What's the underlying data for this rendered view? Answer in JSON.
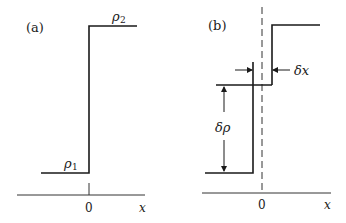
{
  "figure": {
    "panel_a": {
      "label": "(a)",
      "rho_low": "ρ",
      "rho_low_sub": "1",
      "rho_high": "ρ",
      "rho_high_sub": "2",
      "origin_label": "0",
      "axis_label": "x"
    },
    "panel_b": {
      "label": "(b)",
      "delta_x": "δx",
      "delta_rho": "δρ",
      "origin_label": "0",
      "axis_label": "x"
    },
    "colors": {
      "line": "#1a1a1a",
      "axis": "#333333",
      "background": "#ffffff"
    }
  }
}
